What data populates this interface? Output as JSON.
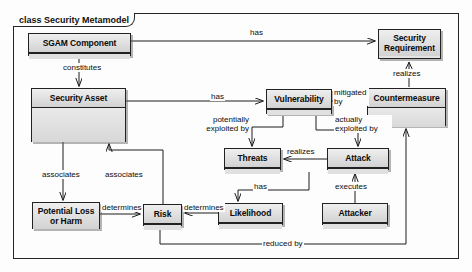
{
  "diagram": {
    "kind_keyword": "class",
    "title": "Security Metamodel",
    "frame_label": "class Security Metamodel",
    "type": "uml-class-diagram",
    "colors": {
      "box_fill": "#e3e3e3",
      "header_fill": "#dedede",
      "stroke": "#1d1d1d",
      "background": "#fdfdfd"
    }
  },
  "classes": [
    {
      "id": "sgam_component",
      "name": "SGAM Component",
      "x": 28,
      "y": 33,
      "w": 103,
      "h": 23
    },
    {
      "id": "security_asset",
      "name": "Security Asset",
      "x": 31,
      "y": 88,
      "w": 95,
      "h": 54
    },
    {
      "id": "security_requirement",
      "name": "Security\nRequirement",
      "name_line1": "Security",
      "name_line2": "Requirement",
      "x": 378,
      "y": 29,
      "w": 63,
      "h": 30
    },
    {
      "id": "vulnerability",
      "name": "Vulnerability",
      "x": 266,
      "y": 89,
      "w": 66,
      "h": 25
    },
    {
      "id": "countermeasure",
      "name": "Countermeasure",
      "x": 367,
      "y": 88,
      "w": 79,
      "h": 38
    },
    {
      "id": "threats",
      "name": "Threats",
      "x": 224,
      "y": 148,
      "w": 57,
      "h": 22
    },
    {
      "id": "attack",
      "name": "Attack",
      "x": 327,
      "y": 148,
      "w": 62,
      "h": 22
    },
    {
      "id": "likelihood",
      "name": "Likelihood",
      "x": 218,
      "y": 203,
      "w": 65,
      "h": 22
    },
    {
      "id": "attacker",
      "name": "Attacker",
      "x": 322,
      "y": 203,
      "w": 66,
      "h": 22
    },
    {
      "id": "potential_loss",
      "name": "Potential Loss\nor Harm",
      "name_line1": "Potential Loss",
      "name_line2": "or Harm",
      "x": 32,
      "y": 202,
      "w": 68,
      "h": 27
    },
    {
      "id": "risk",
      "name": "Risk",
      "x": 143,
      "y": 204,
      "w": 39,
      "h": 22
    }
  ],
  "relations": [
    {
      "id": "r_constitutes",
      "label": "constitutes",
      "from": "sgam_component",
      "to": "security_asset",
      "label_x": 62,
      "label_y": 63
    },
    {
      "id": "r_has_requirement",
      "label": "has",
      "from": "sgam_component",
      "to": "security_requirement",
      "label_x": 249,
      "label_y": 28
    },
    {
      "id": "r_has_vulnerability",
      "label": "has",
      "from": "security_asset",
      "to": "vulnerability",
      "label_x": 210,
      "label_y": 94
    },
    {
      "id": "r_mitigated_by",
      "label": "mitigated by",
      "label_line1": "mitigated",
      "label_line2": "by",
      "from": "vulnerability",
      "to": "countermeasure",
      "label_x": 333,
      "label_y": 89
    },
    {
      "id": "r_realizes_requirement",
      "label": "realizes",
      "from": "countermeasure",
      "to": "security_requirement",
      "label_x": 394,
      "label_y": 70
    },
    {
      "id": "r_potentially_exploited_by",
      "label": "potentially exploited by",
      "label_line1": "potentially",
      "label_line2": "exploited by",
      "from": "vulnerability",
      "to": "threats",
      "label_x": 196,
      "label_y": 118
    },
    {
      "id": "r_actually_exploited_by",
      "label": "actually exploited by",
      "label_line1": "actually",
      "label_line2": "exploited by",
      "from": "vulnerability",
      "to": "attack",
      "label_x": 335,
      "label_y": 118
    },
    {
      "id": "r_realizes_threats",
      "label": "realizes",
      "from": "attack",
      "to": "threats",
      "label_x": 286,
      "label_y": 148
    },
    {
      "id": "r_has_likelihood",
      "label": "has",
      "from": "threats",
      "to": "likelihood",
      "label_x": 253,
      "label_y": 185
    },
    {
      "id": "r_executes",
      "label": "executes",
      "from": "attacker",
      "to": "attack",
      "label_x": 337,
      "label_y": 185
    },
    {
      "id": "r_associates_loss",
      "label": "associates",
      "from": "security_asset",
      "to": "potential_loss",
      "label_x": 46,
      "label_y": 172
    },
    {
      "id": "r_associates_risk",
      "label": "associates",
      "from": "risk",
      "to": "security_asset",
      "label_x": 107,
      "label_y": 172
    },
    {
      "id": "r_determines_risk_loss",
      "label": "determines",
      "from": "potential_loss",
      "to": "risk",
      "label_x": 103,
      "label_y": 200
    },
    {
      "id": "r_determines_risk_likelihood",
      "label": "determines",
      "from": "likelihood",
      "to": "risk",
      "label_x": 186,
      "label_y": 200
    },
    {
      "id": "r_reduced_by",
      "label": "reduced by",
      "from": "risk",
      "to": "countermeasure",
      "label_x": 262,
      "label_y": 240
    }
  ]
}
